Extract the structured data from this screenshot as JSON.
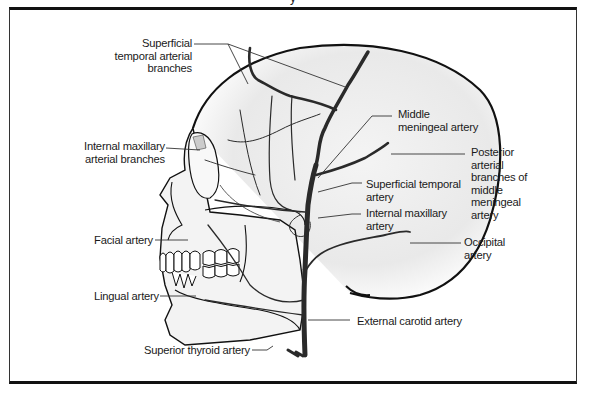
{
  "figure": {
    "title_fragment": "y",
    "colors": {
      "artery": "#2a2a2a",
      "outline": "#111111",
      "leader": "#333333",
      "shading": "#e6e6e6",
      "background": "#ffffff"
    }
  },
  "labels": [
    {
      "id": "superficial-temporal-arterial-branches",
      "lines": [
        "Superficial",
        "temporal arterial",
        "branches"
      ]
    },
    {
      "id": "internal-maxillary-arterial-branches",
      "lines": [
        "Internal maxillary",
        "arterial branches"
      ]
    },
    {
      "id": "facial-artery",
      "lines": [
        "Facial artery"
      ]
    },
    {
      "id": "lingual-artery",
      "lines": [
        "Lingual artery"
      ]
    },
    {
      "id": "superior-thyroid-artery",
      "lines": [
        "Superior thyroid artery"
      ]
    },
    {
      "id": "middle-meningeal-artery",
      "lines": [
        "Middle",
        "meningeal artery"
      ]
    },
    {
      "id": "posterior-arterial-branches",
      "lines": [
        "Posterior",
        "arterial",
        "branches of",
        "middle",
        "meningeal",
        "artery"
      ]
    },
    {
      "id": "superficial-temporal-artery",
      "lines": [
        "Superficial temporal",
        "artery"
      ]
    },
    {
      "id": "internal-maxillary-artery",
      "lines": [
        "Internal maxillary",
        "artery"
      ]
    },
    {
      "id": "occipital-artery",
      "lines": [
        "Occipital",
        "artery"
      ]
    },
    {
      "id": "external-carotid-artery",
      "lines": [
        "External carotid artery"
      ]
    }
  ]
}
